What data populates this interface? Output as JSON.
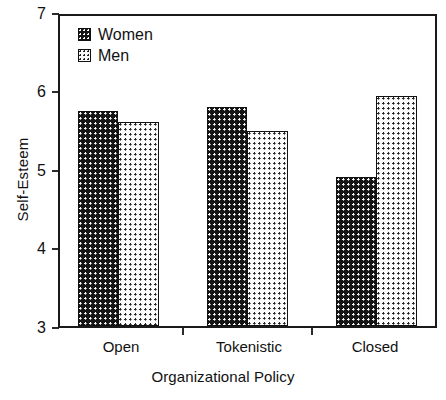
{
  "chart_data": {
    "type": "bar",
    "title": "",
    "xlabel": "Organizational Policy",
    "ylabel": "Self-Esteem",
    "categories": [
      "Open",
      "Tokenistic",
      "Closed"
    ],
    "series": [
      {
        "name": "Women",
        "values": [
          5.78,
          5.82,
          4.92
        ]
      },
      {
        "name": "Men",
        "values": [
          5.63,
          5.52,
          5.97
        ]
      }
    ],
    "ylim": [
      3,
      7
    ],
    "yticks": [
      3,
      4,
      5,
      6,
      7
    ],
    "ytick_labels": [
      "3",
      "4",
      "5",
      "6",
      "7"
    ],
    "grid": false,
    "legend_position": "top-left",
    "legend_entries": [
      "Women",
      "Men"
    ]
  }
}
